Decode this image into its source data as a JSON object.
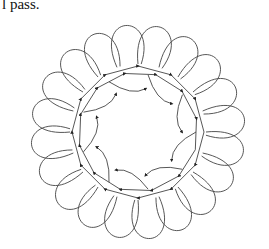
{
  "caption": "l pass.",
  "diagram": {
    "center": [
      138,
      132
    ],
    "outer_feather_count": 20,
    "stroke_color": "#333333",
    "background": "#ffffff",
    "arrows": "direction-of-stitching markers along spine and inner curls"
  }
}
